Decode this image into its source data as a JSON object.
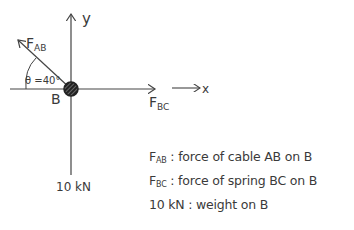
{
  "diagram": {
    "type": "free-body-diagram",
    "point_label": "B",
    "axes": {
      "y_label": "y",
      "x_label": "x"
    },
    "forces": [
      {
        "symbol": "F",
        "subscript": "AB",
        "direction": "up-left",
        "angle_label": "θ =40°"
      },
      {
        "symbol": "F",
        "subscript": "BC",
        "direction": "right"
      },
      {
        "symbol": "10 kN",
        "direction": "down"
      }
    ],
    "angle_label": "θ =40°",
    "weight_label": "10 kN"
  },
  "legend": [
    {
      "symbol": "F",
      "subscript": "AB",
      "description": ": force of cable AB on B"
    },
    {
      "symbol": "F",
      "subscript": "BC",
      "description": ": force of spring BC on B"
    },
    {
      "symbol": "10 kN",
      "subscript": "",
      "description": ": weight on B"
    }
  ]
}
